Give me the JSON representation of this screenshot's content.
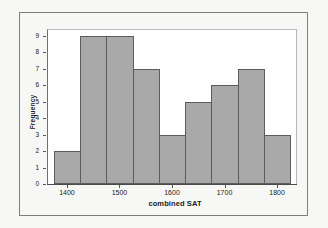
{
  "chart_data": {
    "type": "bar",
    "title": "",
    "subtitle": "",
    "xlabel": "combined SAT",
    "ylabel": "Frequency",
    "categories": [
      "1375-1425",
      "1425-1475",
      "1475-1525",
      "1525-1575",
      "1575-1625",
      "1625-1675",
      "1675-1725",
      "1725-1775",
      "1775-1825"
    ],
    "bin_edges": [
      1375,
      1425,
      1475,
      1525,
      1575,
      1625,
      1675,
      1725,
      1775,
      1825
    ],
    "bin_centers": [
      1400,
      1450,
      1500,
      1550,
      1600,
      1650,
      1700,
      1750,
      1800
    ],
    "values": [
      2,
      9,
      9,
      7,
      3,
      5,
      6,
      7,
      3
    ],
    "bin_width": 50,
    "xlim": [
      1362,
      1838
    ],
    "ylim": [
      0,
      9.4
    ],
    "x_tick_labels": [
      "1400",
      "1500",
      "1600",
      "1700",
      "1800"
    ],
    "x_tick_values": [
      1400,
      1500,
      1600,
      1700,
      1800
    ],
    "y_tick_labels": [
      "0",
      "1",
      "2",
      "3",
      "4",
      "5",
      "6",
      "7",
      "8",
      "9"
    ],
    "y_tick_values": [
      0,
      1,
      2,
      3,
      4,
      5,
      6,
      7,
      8,
      9
    ],
    "grid": false,
    "legend": null,
    "bar_fill_color": "#a9a9a9",
    "bar_edge_color": "#5c5c5c",
    "plot_background_color": "#ffffff",
    "page_background_color": "#f7f7f5",
    "frame_color": "#7d7d7d",
    "text_color": "#1a1a1a"
  }
}
